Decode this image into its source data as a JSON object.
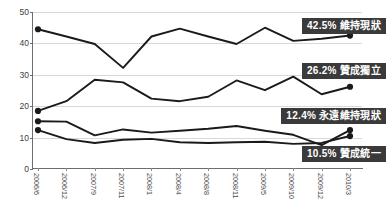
{
  "chart_data": {
    "type": "line",
    "title": "",
    "xlabel": "",
    "ylabel": "",
    "ylim": [
      0,
      50
    ],
    "yticks": [
      0,
      10,
      20,
      30,
      40,
      50
    ],
    "grid": true,
    "legend_position": "inline-right-callouts",
    "categories": [
      "2006/6",
      "2006/12",
      "2007/9",
      "2007/11",
      "2008/1",
      "2008/4",
      "2008/8",
      "2008/11",
      "2009/5",
      "2009/10",
      "2009/12",
      "2010/3"
    ],
    "series": [
      {
        "name": "維持現狀",
        "final_value": "42.5%",
        "values": [
          44.5,
          42.2,
          39.8,
          32.2,
          42.2,
          44.7,
          42.2,
          39.8,
          45.0,
          40.8,
          41.5,
          42.5
        ]
      },
      {
        "name": "贊成獨立",
        "final_value": "26.2%",
        "values": [
          18.5,
          21.6,
          28.4,
          27.6,
          22.4,
          21.6,
          23.0,
          28.2,
          25.1,
          29.4,
          23.8,
          26.2
        ]
      },
      {
        "name": "永遠維持現狀",
        "final_value": "12.4%",
        "values": [
          15.2,
          15.1,
          10.7,
          12.6,
          11.6,
          12.2,
          12.8,
          13.7,
          12.2,
          10.9,
          7.6,
          12.4
        ]
      },
      {
        "name": "贊成統一",
        "final_value": "10.5%",
        "values": [
          12.4,
          9.5,
          8.3,
          9.3,
          9.6,
          8.5,
          8.3,
          8.5,
          8.7,
          8.0,
          8.3,
          10.5
        ]
      }
    ]
  },
  "callouts": [
    {
      "pct": "42.5%",
      "label": "維持現狀"
    },
    {
      "pct": "26.2%",
      "label": "贊成獨立"
    },
    {
      "pct": "12.4%",
      "label": "永遠維持現狀"
    },
    {
      "pct": "10.5%",
      "label": "贊成統一"
    }
  ],
  "colors": {
    "series_stroke": "#1a1a1a",
    "callout_background": "#3a3a3a",
    "callout_text": "#ffffff",
    "gridline": "#d8d8d8",
    "axis": "#6d6d6d",
    "tick_text": "#4a4a4a",
    "plot_background": "#ffffff"
  }
}
